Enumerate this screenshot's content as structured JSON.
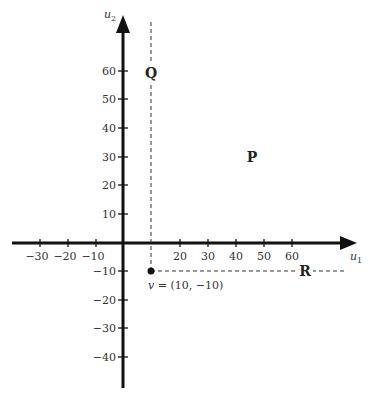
{
  "diagram": {
    "axes": {
      "x_label": "u",
      "x_sub": "1",
      "y_label": "u",
      "y_sub": "2",
      "x_ticks": [
        "−30",
        "−20",
        "−10",
        "20",
        "30",
        "40",
        "50",
        "60"
      ],
      "y_ticks": [
        "60",
        "50",
        "40",
        "30",
        "20",
        "10",
        "−10",
        "−20",
        "−30",
        "−40"
      ]
    },
    "point": {
      "label_var": "v",
      "label_rest": " = (10, −10)",
      "x": 10,
      "y": -10
    },
    "regions": {
      "P": "P",
      "Q": "Q",
      "R": "R"
    },
    "colors": {
      "axis": "#111111",
      "dash": "#333333",
      "text": "#333333"
    }
  }
}
